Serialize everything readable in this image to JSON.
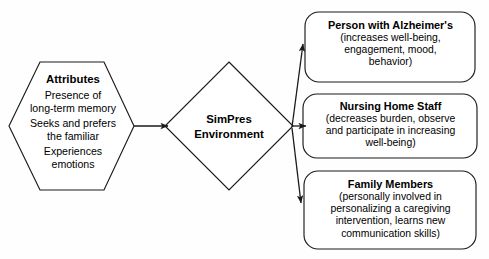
{
  "diagram": {
    "stroke_color": "#1a1a1a",
    "background_color": "#fefefe",
    "nodes": {
      "attributes": {
        "shape": "hexagon",
        "title": "Attributes",
        "lines": [
          "Presence of",
          "long-term memory",
          "Seeks and prefers",
          "the familiar",
          "Experiences",
          "emotions"
        ]
      },
      "environment": {
        "shape": "diamond",
        "line1": "SimPres",
        "line2": "Environment"
      },
      "person": {
        "shape": "rounded-rect",
        "title": "Person with Alzheimer's",
        "lines": [
          "(increases well-being,",
          "engagement, mood,",
          "behavior)"
        ]
      },
      "staff": {
        "shape": "rounded-rect",
        "title": "Nursing Home Staff",
        "lines": [
          "(decreases burden, observe",
          "and participate in increasing",
          "well-being)"
        ]
      },
      "family": {
        "shape": "rounded-rect",
        "title": "Family Members",
        "lines": [
          "(personally involved in",
          "personalizing a caregiving",
          "intervention, learns new",
          "communication skills)"
        ]
      }
    },
    "edges": [
      {
        "name": "attributes-to-environment",
        "from": "attributes",
        "to": "environment",
        "arrow": "single"
      },
      {
        "name": "environment-to-person",
        "from": "environment",
        "to": "person",
        "arrow": "single"
      },
      {
        "name": "environment-to-staff",
        "from": "environment",
        "to": "staff",
        "arrow": "single"
      },
      {
        "name": "environment-to-family",
        "from": "environment",
        "to": "family",
        "arrow": "single"
      }
    ]
  }
}
